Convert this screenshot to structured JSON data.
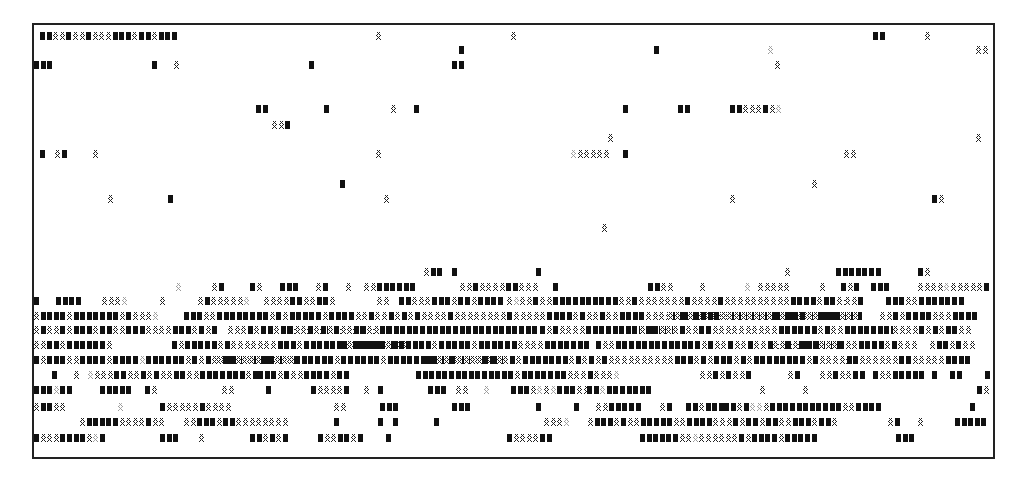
{
  "figure": {
    "legend_codes": {
      "#": "dark-block",
      "x": "hatched-block",
      "o": "light-stipple-block",
      " ": "empty"
    },
    "cell_pitch_x": 6.6,
    "origin_x": 34,
    "rows": [
      {
        "y": 32,
        "segments": [
          [
            40,
            "##xx#xx#xxx###x##x###"
          ],
          [
            376,
            "x"
          ],
          [
            511,
            "x"
          ],
          [
            873,
            "##"
          ],
          [
            925,
            "x"
          ]
        ]
      },
      {
        "y": 46,
        "segments": [
          [
            459,
            "#"
          ],
          [
            654,
            "#"
          ],
          [
            768,
            "o"
          ],
          [
            976,
            "xx"
          ]
        ]
      },
      {
        "y": 61,
        "segments": [
          [
            34,
            "###"
          ],
          [
            152,
            "#"
          ],
          [
            174,
            "x"
          ],
          [
            309,
            "#"
          ],
          [
            452,
            "##"
          ],
          [
            775,
            "x"
          ]
        ]
      },
      {
        "y": 105,
        "segments": [
          [
            256,
            "##"
          ],
          [
            324,
            "#"
          ],
          [
            391,
            "x"
          ],
          [
            414,
            "#"
          ],
          [
            623,
            "#"
          ],
          [
            678,
            "##"
          ],
          [
            730,
            "##xxx#xo"
          ]
        ]
      },
      {
        "y": 121,
        "segments": [
          [
            272,
            "xx#"
          ]
        ]
      },
      {
        "y": 134,
        "segments": [
          [
            608,
            "x"
          ],
          [
            976,
            "x"
          ]
        ]
      },
      {
        "y": 150,
        "segments": [
          [
            40,
            "#"
          ],
          [
            55,
            "x#"
          ],
          [
            93,
            "x"
          ],
          [
            376,
            "x"
          ],
          [
            571,
            "oxxxxx"
          ],
          [
            623,
            "#"
          ],
          [
            844,
            "xx"
          ]
        ]
      },
      {
        "y": 180,
        "segments": [
          [
            340,
            "#"
          ],
          [
            812,
            "x"
          ]
        ]
      },
      {
        "y": 195,
        "segments": [
          [
            108,
            "x"
          ],
          [
            168,
            "#"
          ],
          [
            384,
            "x"
          ],
          [
            730,
            "x"
          ],
          [
            932,
            "#x"
          ]
        ]
      },
      {
        "y": 224,
        "segments": [
          [
            602,
            "x"
          ]
        ]
      },
      {
        "y": 268,
        "segments": [
          [
            424,
            "x##"
          ],
          [
            452,
            "#"
          ],
          [
            536,
            "#"
          ],
          [
            785,
            "x"
          ],
          [
            836,
            "#######"
          ],
          [
            918,
            "#x"
          ]
        ]
      },
      {
        "y": 283,
        "segments": [
          [
            176,
            "o"
          ],
          [
            212,
            "x#"
          ],
          [
            250,
            "#x"
          ],
          [
            280,
            "###"
          ],
          [
            316,
            "x#"
          ],
          [
            346,
            "x"
          ],
          [
            364,
            "xx######"
          ],
          [
            460,
            "xx#xxxx##xxx"
          ],
          [
            553,
            "#"
          ],
          [
            648,
            "##xx"
          ],
          [
            700,
            "x"
          ],
          [
            745,
            "o"
          ],
          [
            758,
            "xxxxx"
          ],
          [
            820,
            "x"
          ],
          [
            841,
            "#x#"
          ],
          [
            871,
            "###"
          ],
          [
            918,
            "xxxxoxxxxx#"
          ]
        ]
      },
      {
        "y": 297,
        "segments": [
          [
            34,
            "#"
          ],
          [
            56,
            "####"
          ],
          [
            102,
            "xxxo"
          ],
          [
            160,
            "x"
          ],
          [
            198,
            "x#xxxxxo"
          ],
          [
            264,
            "xxxx##xx##x"
          ],
          [
            377,
            "xx"
          ],
          [
            399,
            "##xxx###x##x####"
          ],
          [
            507,
            "xoxx#xx##########xx#xxxxxxx#xxxx#xxxxxxxxxx####x##xx"
          ],
          [
            845,
            "xx#"
          ],
          [
            886,
            "###xx#######"
          ]
        ]
      },
      {
        "y": 312,
        "segments": [
          [
            34,
            "x####x#######x#xxxo"
          ],
          [
            184,
            "###xx########x#x#####x####xx#xx#x#x#xxxx#xxxxxxxx#xxxxx####x#xx#xx####xxxx####xxxxx##########xx########"
          ],
          [
            668,
            "xx#x####xxxxxxxx#x###xx###xxx"
          ],
          [
            880,
            "xx#x####xxx####"
          ]
        ]
      },
      {
        "y": 326,
        "segments": [
          [
            34,
            "x#xx#x###x##xx###xxxx###x#x#"
          ],
          [
            228,
            "xxx#x##x##xxxxx##xxx#xxx#"
          ],
          [
            288,
            "#xx#x#x#xx##xx########################"
          ],
          [
            540,
            "#x#xxxx##############"
          ],
          [
            640,
            "x##xxx#xx##xxxxxxxxxx######x#xx########"
          ],
          [
            893,
            "xxxx#x#x##xx"
          ]
        ]
      },
      {
        "y": 341,
        "segments": [
          [
            34,
            "xx##x######x"
          ],
          [
            172,
            "#x#####x#xxxxxxx###x#######x####x#xx"
          ],
          [
            340,
            "#x#####x######x#####x######xxxx#######"
          ],
          [
            596,
            "#xx#############x#xx#xx#xx#x#xx######"
          ],
          [
            773,
            "xx#x###xxx#xx####x#xxx"
          ],
          [
            930,
            "x##x#xx"
          ]
        ]
      },
      {
        "y": 356,
        "segments": [
          [
            34,
            "#x###xx####x####o######x#x#xx###x###x#x#"
          ],
          [
            216,
            "x##xxxx##xxx######x######x##########x##x#x##"
          ],
          [
            424,
            "##xx#xxxx##xx#x#######x#x#x#xxxxxxxxxxxx"
          ],
          [
            668,
            "x###x#x###x#x########x#xxxxx"
          ],
          [
            840,
            "x##xxxxxx##xxxxx####"
          ]
        ]
      },
      {
        "y": 371,
        "segments": [
          [
            52,
            "#"
          ],
          [
            74,
            "x"
          ],
          [
            88,
            "oxxx##xx#x#xx##xx#######x#"
          ],
          [
            258,
            "###x#xx###"
          ],
          [
            324,
            "#x##"
          ],
          [
            416,
            "###############x#######xxx#xxxo"
          ],
          [
            700,
            "xx#x#xx#"
          ],
          [
            788,
            "x#"
          ],
          [
            820,
            "xx#xx##"
          ],
          [
            873,
            "#xx#####"
          ],
          [
            932,
            "#"
          ],
          [
            950,
            "##"
          ],
          [
            985,
            "#"
          ]
        ]
      },
      {
        "y": 386,
        "segments": [
          [
            34,
            "###o##"
          ],
          [
            100,
            "#####"
          ],
          [
            145,
            "#x"
          ],
          [
            222,
            "xx"
          ],
          [
            266,
            "#"
          ],
          [
            311,
            "#xxxx#"
          ],
          [
            364,
            "x"
          ],
          [
            378,
            "#"
          ],
          [
            428,
            "###"
          ],
          [
            456,
            "xx"
          ],
          [
            484,
            "o"
          ],
          [
            511,
            "###xoxo###xx"
          ],
          [
            587,
            "##o#######"
          ],
          [
            760,
            "x"
          ],
          [
            803,
            "x"
          ],
          [
            977,
            "#x"
          ]
        ]
      },
      {
        "y": 403,
        "segments": [
          [
            34,
            "x##xx"
          ],
          [
            118,
            "o"
          ],
          [
            160,
            "#xxxxx#xxxx"
          ],
          [
            334,
            "xx"
          ],
          [
            380,
            "###"
          ],
          [
            452,
            "###"
          ],
          [
            536,
            "#"
          ],
          [
            574,
            "#"
          ],
          [
            596,
            "xx#####"
          ],
          [
            660,
            "x#"
          ],
          [
            686,
            "##x###"
          ],
          [
            724,
            "##x#oox###########xx####"
          ],
          [
            970,
            "#"
          ]
        ]
      },
      {
        "y": 418,
        "segments": [
          [
            80,
            "x#####xxxx#xx"
          ],
          [
            184,
            "xx##"
          ],
          [
            210,
            "#x##xxxxxxxx"
          ],
          [
            334,
            "#"
          ],
          [
            378,
            "#"
          ],
          [
            393,
            "#"
          ],
          [
            434,
            "#"
          ],
          [
            544,
            "xxxo"
          ],
          [
            588,
            "x###x#xx#####xx####xxx#x##x##xx###x##x"
          ],
          [
            888,
            "x#"
          ],
          [
            918,
            "x"
          ],
          [
            955,
            "#####"
          ]
        ]
      },
      {
        "y": 434,
        "segments": [
          [
            34,
            "#xxx####xo#"
          ],
          [
            160,
            "###"
          ],
          [
            199,
            "x"
          ],
          [
            250,
            "##x#x#"
          ],
          [
            318,
            "#xx##x#"
          ],
          [
            386,
            "#"
          ],
          [
            507,
            "#xxxx##"
          ],
          [
            640,
            "######xxoxxxxxx#x####x#####"
          ],
          [
            896,
            "###"
          ]
        ]
      }
    ]
  }
}
